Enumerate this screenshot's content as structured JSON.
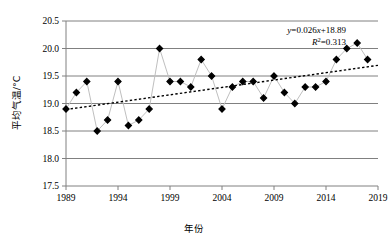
{
  "chart_data": {
    "type": "line",
    "title": "",
    "subtitle": "",
    "xlabel": "年份",
    "ylabel": "平均气温/°C",
    "xlim": [
      1989,
      2019
    ],
    "ylim": [
      17.5,
      20.5
    ],
    "ytick_step": 0.5,
    "xtick_step": 5,
    "grid": true,
    "legend": false,
    "x_tick_labels": [
      "1989",
      "1994",
      "1999",
      "2004",
      "2009",
      "2014",
      "2019"
    ],
    "y_tick_labels": [
      "17.5",
      "18.0",
      "18.5",
      "19.0",
      "19.5",
      "20.0",
      "20.5"
    ],
    "x": [
      1989,
      1990,
      1991,
      1992,
      1993,
      1994,
      1995,
      1996,
      1997,
      1998,
      1999,
      2000,
      2001,
      2002,
      2003,
      2004,
      2005,
      2006,
      2007,
      2008,
      2009,
      2010,
      2011,
      2012,
      2013,
      2014,
      2015,
      2016,
      2017,
      2018
    ],
    "series": [
      {
        "name": "年平均气温",
        "marker": "diamond",
        "marker_color": "#000000",
        "line_color": "#bfbfbf",
        "values": [
          18.9,
          19.2,
          19.4,
          18.5,
          18.7,
          19.4,
          18.6,
          18.7,
          18.9,
          20.0,
          19.4,
          19.4,
          19.3,
          19.8,
          19.5,
          18.9,
          19.3,
          19.4,
          19.4,
          19.1,
          19.5,
          19.2,
          19.0,
          19.3,
          19.3,
          19.4,
          19.8,
          20.0,
          20.1,
          19.8
        ]
      }
    ],
    "trendline": {
      "type": "linear",
      "style": "dotted",
      "color": "#000000",
      "slope": 0.026,
      "intercept": 18.89,
      "y_start": 18.89,
      "y_end": 19.694,
      "equation": "y=0.026x+18.89",
      "r_squared_label": "R",
      "r_squared_exponent": "2",
      "r_squared_value": "=0.313"
    },
    "annotations": [
      {
        "name": "trend-equation",
        "text": "y=0.026x+18.89"
      },
      {
        "name": "r-squared",
        "text": "R²=0.313"
      }
    ]
  }
}
